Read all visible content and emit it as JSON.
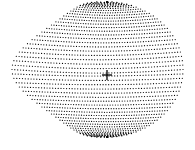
{
  "figure": {
    "shape": "dotted-egg-surface",
    "width": 195,
    "height": 150,
    "background": "#ffffff",
    "dot_color": "#000000",
    "bounds": {
      "left": 12,
      "right": 183,
      "top": 6,
      "bottom": 141
    },
    "crosshair": {
      "x": 107,
      "y": 75,
      "size": 10,
      "color": "#000000"
    },
    "rows": 48,
    "cols": 60
  }
}
